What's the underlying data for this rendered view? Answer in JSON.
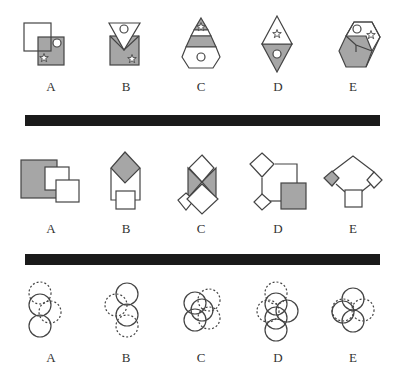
{
  "colors": {
    "stroke": "#444444",
    "fill_gray": "#a6a6a6",
    "bar": "#1a1a1a",
    "background": "#ffffff"
  },
  "rows": [
    {
      "name": "row-1",
      "labels": [
        "A",
        "B",
        "C",
        "D",
        "E"
      ]
    },
    {
      "name": "row-2",
      "labels": [
        "A",
        "B",
        "C",
        "D",
        "E"
      ]
    },
    {
      "name": "row-3",
      "labels": [
        "A",
        "B",
        "C",
        "D",
        "E"
      ]
    }
  ],
  "icons": {
    "star": "star-icon",
    "circle": "circle-icon"
  }
}
